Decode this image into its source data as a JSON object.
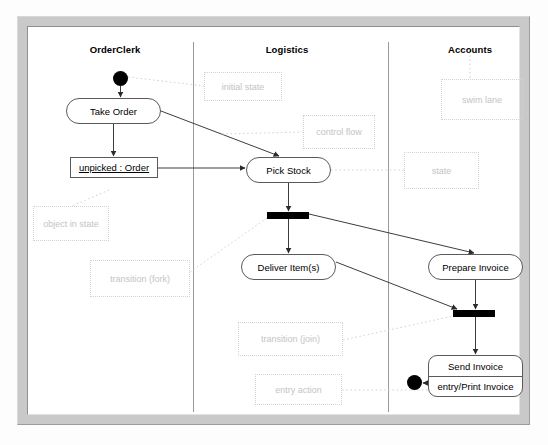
{
  "diagram": {
    "type": "uml-activity-diagram",
    "background_color": "#ffffff",
    "frame_color": "#c9c9c9",
    "line_color": "#5a5a5a",
    "annotation_color": "#c4c4c4"
  },
  "lanes": [
    {
      "label": "OrderClerk",
      "x": 115
    },
    {
      "label": "Logistics",
      "x": 287
    },
    {
      "label": "Accounts",
      "x": 470
    }
  ],
  "lane_dividers": [
    193,
    388
  ],
  "nodes": [
    {
      "id": "initial",
      "kind": "initial-state",
      "label": "",
      "x": 113,
      "y": 71,
      "w": 15,
      "h": 15
    },
    {
      "id": "take-order",
      "kind": "action-state",
      "label": "Take Order",
      "x": 66,
      "y": 98,
      "w": 95,
      "h": 26
    },
    {
      "id": "unpicked-order",
      "kind": "object-in-state",
      "label": "unpicked : Order",
      "x": 70,
      "y": 157,
      "w": 88,
      "h": 21
    },
    {
      "id": "pick-stock",
      "kind": "action-state",
      "label": "Pick Stock",
      "x": 246,
      "y": 157,
      "w": 85,
      "h": 26
    },
    {
      "id": "fork-bar",
      "kind": "fork-bar",
      "label": "",
      "x": 267,
      "y": 212,
      "w": 42,
      "h": 7
    },
    {
      "id": "deliver-items",
      "kind": "action-state",
      "label": "Deliver Item(s)",
      "x": 241,
      "y": 254,
      "w": 95,
      "h": 26
    },
    {
      "id": "prepare-invoice",
      "kind": "action-state",
      "label": "Prepare Invoice",
      "x": 428,
      "y": 254,
      "w": 95,
      "h": 26
    },
    {
      "id": "join-bar",
      "kind": "join-bar",
      "label": "",
      "x": 453,
      "y": 310,
      "w": 42,
      "h": 7
    },
    {
      "id": "send-invoice",
      "kind": "composite-state",
      "label": "Send Invoice",
      "entry_label": "entry/Print Invoice",
      "x": 428,
      "y": 355,
      "w": 95,
      "h": 42
    },
    {
      "id": "final",
      "kind": "final-state",
      "label": "",
      "x": 407,
      "y": 375,
      "w": 15,
      "h": 15
    }
  ],
  "annotations": [
    {
      "id": "initial-state-note",
      "label": "initial state",
      "x": 204,
      "y": 72,
      "w": 78,
      "h": 29
    },
    {
      "id": "swim-lane-note",
      "label": "swim lane",
      "x": 441,
      "y": 79,
      "w": 82,
      "h": 41
    },
    {
      "id": "control-flow-note",
      "label": "control flow",
      "x": 303,
      "y": 115,
      "w": 72,
      "h": 34
    },
    {
      "id": "state-note",
      "label": "state",
      "x": 404,
      "y": 152,
      "w": 75,
      "h": 37
    },
    {
      "id": "object-in-state-note",
      "label": "object in state",
      "x": 33,
      "y": 206,
      "w": 76,
      "h": 35
    },
    {
      "id": "transition-fork-note",
      "label": "transition (fork)",
      "x": 90,
      "y": 260,
      "w": 100,
      "h": 37
    },
    {
      "id": "transition-join-note",
      "label": "transition (join)",
      "x": 238,
      "y": 322,
      "w": 105,
      "h": 34
    },
    {
      "id": "entry-action-note",
      "label": "entry action",
      "x": 255,
      "y": 374,
      "w": 87,
      "h": 31
    }
  ],
  "edges": [
    {
      "id": "initial-to-take-order",
      "kind": "control-flow",
      "from": "initial",
      "to": "take-order"
    },
    {
      "id": "take-order-to-unpicked",
      "kind": "control-flow",
      "from": "take-order",
      "to": "unpicked-order"
    },
    {
      "id": "take-order-to-pick-stock",
      "kind": "control-flow",
      "from": "take-order",
      "to": "pick-stock"
    },
    {
      "id": "unpicked-to-pick-stock",
      "kind": "control-flow",
      "from": "unpicked-order",
      "to": "pick-stock"
    },
    {
      "id": "pick-stock-to-fork",
      "kind": "control-flow",
      "from": "pick-stock",
      "to": "fork-bar"
    },
    {
      "id": "fork-to-deliver",
      "kind": "control-flow",
      "from": "fork-bar",
      "to": "deliver-items"
    },
    {
      "id": "fork-to-prepare-invoice",
      "kind": "control-flow",
      "from": "fork-bar",
      "to": "prepare-invoice"
    },
    {
      "id": "deliver-to-join",
      "kind": "control-flow",
      "from": "deliver-items",
      "to": "join-bar"
    },
    {
      "id": "prepare-invoice-to-join",
      "kind": "control-flow",
      "from": "prepare-invoice",
      "to": "join-bar"
    },
    {
      "id": "join-to-send-invoice",
      "kind": "control-flow",
      "from": "join-bar",
      "to": "send-invoice"
    },
    {
      "id": "send-invoice-to-final",
      "kind": "control-flow",
      "from": "send-invoice",
      "to": "final"
    }
  ]
}
